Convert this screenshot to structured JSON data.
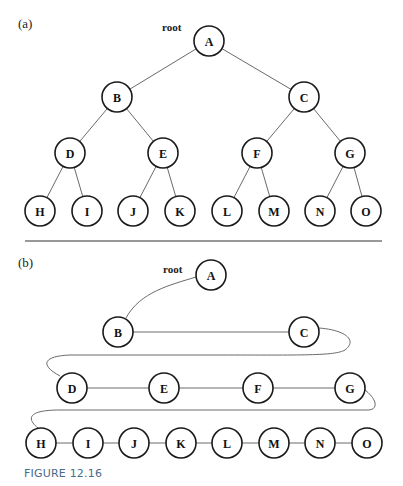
{
  "figure": {
    "caption": "FIGURE 12.16",
    "panel_a": {
      "label": "(a)",
      "root_label": "root",
      "nodes": [
        {
          "id": "A",
          "x": 209,
          "y": 41
        },
        {
          "id": "B",
          "x": 117,
          "y": 97
        },
        {
          "id": "C",
          "x": 304,
          "y": 97
        },
        {
          "id": "D",
          "x": 70,
          "y": 153
        },
        {
          "id": "E",
          "x": 163,
          "y": 153
        },
        {
          "id": "F",
          "x": 257,
          "y": 153
        },
        {
          "id": "G",
          "x": 350,
          "y": 153
        },
        {
          "id": "H",
          "x": 40,
          "y": 211
        },
        {
          "id": "I",
          "x": 87,
          "y": 211
        },
        {
          "id": "J",
          "x": 133,
          "y": 211
        },
        {
          "id": "K",
          "x": 180,
          "y": 211
        },
        {
          "id": "L",
          "x": 227,
          "y": 211
        },
        {
          "id": "M",
          "x": 274,
          "y": 211
        },
        {
          "id": "N",
          "x": 320,
          "y": 211
        },
        {
          "id": "O",
          "x": 366,
          "y": 211
        }
      ],
      "edges": [
        [
          "A",
          "B"
        ],
        [
          "A",
          "C"
        ],
        [
          "B",
          "D"
        ],
        [
          "B",
          "E"
        ],
        [
          "C",
          "F"
        ],
        [
          "C",
          "G"
        ],
        [
          "D",
          "H"
        ],
        [
          "D",
          "I"
        ],
        [
          "E",
          "J"
        ],
        [
          "E",
          "K"
        ],
        [
          "F",
          "L"
        ],
        [
          "F",
          "M"
        ],
        [
          "G",
          "N"
        ],
        [
          "G",
          "O"
        ]
      ]
    },
    "panel_b": {
      "label": "(b)",
      "root_label": "root",
      "nodes": [
        {
          "id": "A",
          "x": 211,
          "y": 275
        },
        {
          "id": "B",
          "x": 118,
          "y": 332
        },
        {
          "id": "C",
          "x": 304,
          "y": 332
        },
        {
          "id": "D",
          "x": 72,
          "y": 388
        },
        {
          "id": "E",
          "x": 164,
          "y": 388
        },
        {
          "id": "F",
          "x": 258,
          "y": 388
        },
        {
          "id": "G",
          "x": 350,
          "y": 388
        },
        {
          "id": "H",
          "x": 41,
          "y": 443
        },
        {
          "id": "I",
          "x": 88,
          "y": 443
        },
        {
          "id": "J",
          "x": 134,
          "y": 443
        },
        {
          "id": "K",
          "x": 181,
          "y": 443
        },
        {
          "id": "L",
          "x": 227,
          "y": 443
        },
        {
          "id": "M",
          "x": 274,
          "y": 443
        },
        {
          "id": "N",
          "x": 320,
          "y": 443
        },
        {
          "id": "O",
          "x": 367,
          "y": 443
        }
      ],
      "sequence": [
        "A",
        "B",
        "C",
        "D",
        "E",
        "F",
        "G",
        "H",
        "I",
        "J",
        "K",
        "L",
        "M",
        "N",
        "O"
      ]
    }
  }
}
